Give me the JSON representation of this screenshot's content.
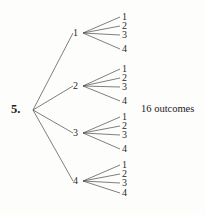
{
  "diagram": {
    "kind": "probability-tree-diagram",
    "problem_number": "5.",
    "summary_text": "16 outcomes",
    "line_color": "#4a4748",
    "text_color": "#222021",
    "background_color": "#fdfdfc",
    "root": {
      "x": 33,
      "y": 110
    },
    "level1": [
      {
        "label": "1",
        "x": 78,
        "y": 33,
        "fan_x": 83
      },
      {
        "label": "2",
        "x": 78,
        "y": 86,
        "fan_x": 83
      },
      {
        "label": "3",
        "x": 78,
        "y": 133,
        "fan_x": 83
      },
      {
        "label": "4",
        "x": 78,
        "y": 181,
        "fan_x": 83
      }
    ],
    "leaf_x": 120,
    "leaf_groups": [
      {
        "parent": "1",
        "leaves": [
          {
            "label": "1",
            "y": 17
          },
          {
            "label": "2",
            "y": 26
          },
          {
            "label": "3",
            "y": 35
          },
          {
            "label": "4",
            "y": 49
          }
        ]
      },
      {
        "parent": "2",
        "leaves": [
          {
            "label": "1",
            "y": 69
          },
          {
            "label": "2",
            "y": 78
          },
          {
            "label": "3",
            "y": 87
          },
          {
            "label": "4",
            "y": 101
          }
        ]
      },
      {
        "parent": "3",
        "leaves": [
          {
            "label": "1",
            "y": 117
          },
          {
            "label": "2",
            "y": 126
          },
          {
            "label": "3",
            "y": 135
          },
          {
            "label": "4",
            "y": 149
          }
        ]
      },
      {
        "parent": "4",
        "leaves": [
          {
            "label": "1",
            "y": 165
          },
          {
            "label": "2",
            "y": 174
          },
          {
            "label": "3",
            "y": 183
          },
          {
            "label": "4",
            "y": 193
          }
        ]
      }
    ]
  }
}
